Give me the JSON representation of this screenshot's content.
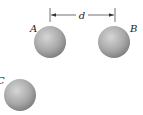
{
  "diagram": {
    "dimension": {
      "label": "d",
      "between": [
        "A",
        "B"
      ]
    },
    "spheres": [
      {
        "label": "A",
        "cx": 50,
        "cy": 42,
        "r": 16
      },
      {
        "label": "B",
        "cx": 114,
        "cy": 42,
        "r": 16
      },
      {
        "label": "C",
        "cx": 20,
        "cy": 95,
        "r": 16
      }
    ],
    "colors": {
      "sphere_light": "#d2d2d2",
      "sphere_mid": "#a8a8a8",
      "sphere_dark": "#7d7d7d",
      "line": "#333333"
    }
  }
}
